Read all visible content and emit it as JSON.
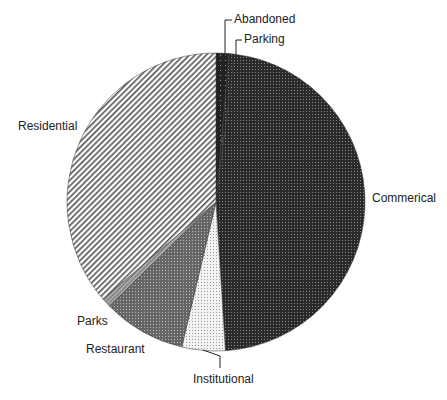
{
  "chart_data": {
    "type": "pie",
    "title": "",
    "start_angle_deg": 0,
    "direction": "clockwise",
    "slices": [
      {
        "label": "Abandoned",
        "value": 1.4,
        "pattern": "dark-sparse-dots"
      },
      {
        "label": "Parking",
        "value": 0.6,
        "pattern": "dark-dots"
      },
      {
        "label": "Commerical",
        "value": 47.0,
        "pattern": "dark-dots"
      },
      {
        "label": "Institutional",
        "value": 4.7,
        "pattern": "light-dots"
      },
      {
        "label": "Restaurant",
        "value": 9.0,
        "pattern": "medium-dots"
      },
      {
        "label": "Parks",
        "value": 1.0,
        "pattern": "gray-stripes"
      },
      {
        "label": "Residential",
        "value": 36.3,
        "pattern": "diagonal-hatch"
      }
    ],
    "legend": "none (direct labels)"
  },
  "labels": {
    "abandoned": "Abandoned",
    "parking": "Parking",
    "commercial": "Commerical",
    "institutional": "Institutional",
    "restaurant": "Restaurant",
    "parks": "Parks",
    "residential": "Residential"
  }
}
